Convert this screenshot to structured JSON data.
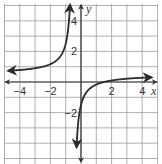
{
  "chart_data": {
    "type": "line",
    "title": "",
    "xlabel": "x",
    "ylabel": "y",
    "xlim": [
      -5,
      5
    ],
    "ylim": [
      -5,
      5
    ],
    "grid": true,
    "x_ticks": [
      -4,
      -2,
      2,
      4
    ],
    "y_ticks": [
      4,
      2,
      -2
    ],
    "x_tick_labels": [
      "−4",
      "−2",
      "2",
      "4"
    ],
    "y_tick_labels": [
      "4",
      "2",
      "−2"
    ],
    "function_approx": "y = -1/(x + 0.5) + 0.5",
    "vertical_asymptote": -0.5,
    "horizontal_asymptote": 0.5,
    "series": [
      {
        "name": "left-branch",
        "x": [
          -4.7,
          -4,
          -3,
          -2,
          -1.5,
          -1.2,
          -1,
          -0.85,
          -0.75,
          -0.7
        ],
        "y": [
          0.74,
          0.79,
          0.9,
          1.17,
          1.5,
          1.93,
          2.5,
          3.36,
          4.5,
          5.0
        ]
      },
      {
        "name": "right-branch",
        "x": [
          -0.3,
          -0.25,
          -0.1,
          0,
          0.5,
          1,
          1.5,
          2,
          3,
          4.5
        ],
        "y": [
          -4.5,
          -3.5,
          -2.0,
          -1.5,
          -0.5,
          -0.17,
          0.0,
          0.1,
          0.21,
          0.3
        ]
      }
    ],
    "colors": {
      "curve": "#2b2b2b",
      "axis": "#333333",
      "grid": "#9a9a9a"
    }
  }
}
